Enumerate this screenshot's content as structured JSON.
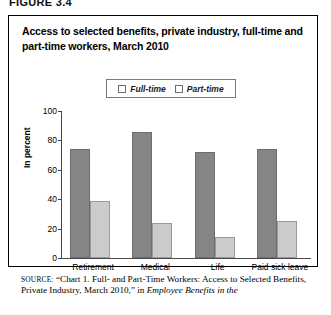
{
  "figure_label": "FIGURE 3.4",
  "chart_title": "Access to selected benefits, private industry, full-time and part-time workers, March 2010",
  "legend": {
    "items": [
      {
        "label": "Full-time",
        "color": "#858585"
      },
      {
        "label": "Part-time",
        "color": "#cbcbcb"
      }
    ]
  },
  "axis": {
    "ylabel": "In percent",
    "yticks": [
      "100",
      "80",
      "60",
      "40",
      "20",
      "0"
    ]
  },
  "source": {
    "prefix": "SOURCE:",
    "text_1": "“Chart 1. Full- and Part-Time Workers: Access to Selected Benefits, Private Industry, March 2010,” in ",
    "italic_1": "Employee Benefits in the"
  },
  "chart_data": {
    "type": "bar",
    "title": "Access to selected benefits, private industry, full-time and part-time workers, March 2010",
    "xlabel": "",
    "ylabel": "In percent",
    "ylim": [
      0,
      100
    ],
    "yticks": [
      0,
      20,
      40,
      60,
      80,
      100
    ],
    "grid": false,
    "legend_position": "top-center",
    "categories": [
      "Retirement",
      "Medical",
      "Life",
      "Paid sick leave"
    ],
    "series": [
      {
        "name": "Full-time",
        "color": "#858585",
        "values": [
          74,
          86,
          72,
          74
        ]
      },
      {
        "name": "Part-time",
        "color": "#cbcbcb",
        "values": [
          39,
          24,
          14,
          25
        ]
      }
    ]
  }
}
